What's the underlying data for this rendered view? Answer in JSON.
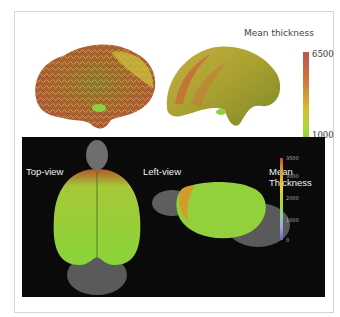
{
  "top_figure": {
    "colorbar": {
      "title": "Mean thickness",
      "max": "6500",
      "min": "1000",
      "colors": [
        "#c0534a",
        "#d7c030",
        "#8fd03a"
      ]
    }
  },
  "bottom_figure": {
    "labels": {
      "top_view": "Top-view",
      "left_view": "Left-view",
      "colorbar_title": "Mean Thickness"
    },
    "colorbar_ticks": [
      "3500",
      "3000",
      "2000",
      "1000",
      "0"
    ],
    "background": "#0a0a0a"
  }
}
